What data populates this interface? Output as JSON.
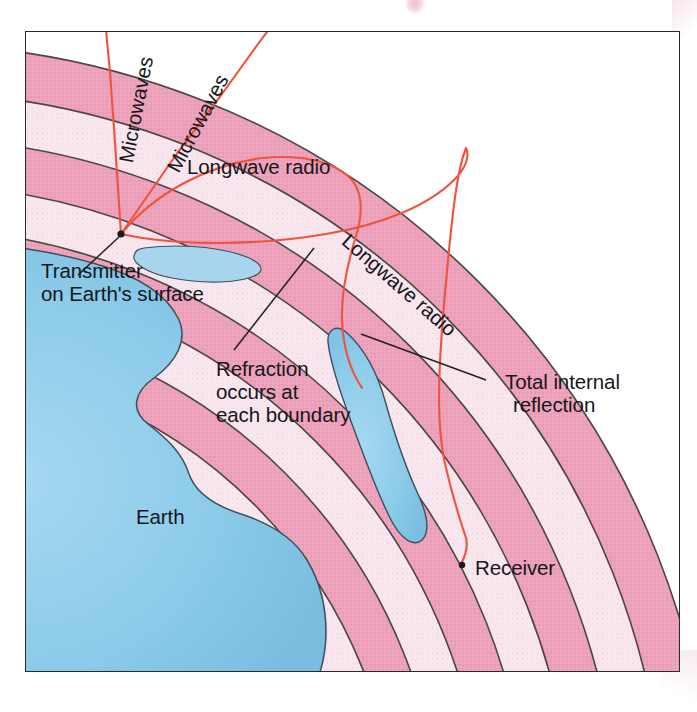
{
  "figure": {
    "title_alt": "Refraction and total internal reflection of radio waves in the atmosphere",
    "labels": {
      "microwaves_left": "Microwaves",
      "microwaves_right": "Microwaves",
      "longwave_radio_top": "Longwave radio",
      "longwave_radio_right": "Longwave radio",
      "transmitter_line1": "Transmitter",
      "transmitter_line2": "on Earth's surface",
      "refraction_line1": "Refraction",
      "refraction_line2": "occurs at",
      "refraction_line3": "each boundary",
      "total_internal_line1": "Total internal",
      "total_internal_line2": "reflection",
      "earth": "Earth",
      "receiver": "Receiver"
    },
    "markers": {
      "transmitter_point": "transmitter-dot",
      "receiver_point": "receiver-dot"
    },
    "colors": {
      "ray": "#f0523c",
      "band_dense": "#eda2bb",
      "band_sparse": "#f8e4ed",
      "band_outline": "#4a4640",
      "ocean": "#8ecbe8",
      "land": "#b5cc7e",
      "land_deep": "#a3bf6d",
      "text": "#15161c",
      "frame": "#2a2a28",
      "leader": "#23201d"
    },
    "atmosphere": {
      "layer_count": 8,
      "description": "Alternating dense and sparse atmospheric layers shown as concentric arcs above Earth's surface"
    },
    "rays": [
      {
        "name": "microwave-ray-1",
        "behavior": "escapes-to-space",
        "label": "Microwaves"
      },
      {
        "name": "microwave-ray-2",
        "behavior": "escapes-to-space",
        "label": "Microwaves"
      },
      {
        "name": "longwave-ray-1",
        "behavior": "refracts-and-returns",
        "label": "Longwave radio"
      },
      {
        "name": "longwave-ray-2",
        "behavior": "total-internal-reflection",
        "label": "Longwave radio"
      }
    ]
  }
}
